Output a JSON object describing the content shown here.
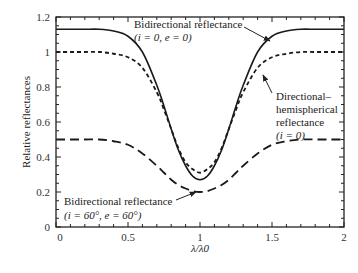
{
  "chart_data": {
    "type": "line",
    "title": "",
    "xlabel": "λ/λ0",
    "ylabel": "Relative reflectances",
    "xlim": [
      0,
      2
    ],
    "ylim": [
      0,
      1.2
    ],
    "x_ticks": [
      "0",
      "0.5",
      "1",
      "1.5",
      "2"
    ],
    "y_ticks": [
      "0",
      "0.2",
      "0.4",
      "0.6",
      "0.8",
      "1",
      "1.2"
    ],
    "grid": false,
    "legend": "annotations",
    "x": [
      0,
      0.1,
      0.2,
      0.3,
      0.4,
      0.5,
      0.6,
      0.7,
      0.75,
      0.8,
      0.85,
      0.9,
      0.95,
      1.0,
      1.05,
      1.1,
      1.15,
      1.2,
      1.25,
      1.3,
      1.4,
      1.5,
      1.6,
      1.7,
      1.8,
      1.9,
      2.0
    ],
    "series": [
      {
        "name": "Bidirectional reflectance (i = 0, e = 0)",
        "style": "solid",
        "values": [
          1.13,
          1.13,
          1.13,
          1.13,
          1.12,
          1.09,
          1.0,
          0.81,
          0.69,
          0.56,
          0.44,
          0.35,
          0.29,
          0.27,
          0.29,
          0.35,
          0.44,
          0.56,
          0.69,
          0.81,
          1.0,
          1.09,
          1.12,
          1.13,
          1.13,
          1.13,
          1.13
        ]
      },
      {
        "name": "Directional–hemispherical reflectance (i = 0)",
        "style": "short-dash",
        "values": [
          1.0,
          1.0,
          1.0,
          1.0,
          0.99,
          0.97,
          0.91,
          0.77,
          0.67,
          0.56,
          0.45,
          0.37,
          0.33,
          0.31,
          0.33,
          0.37,
          0.45,
          0.56,
          0.67,
          0.77,
          0.91,
          0.97,
          0.99,
          1.0,
          1.0,
          1.0,
          1.0
        ]
      },
      {
        "name": "Bidirectional reflectance (i = 60°, e = 60°)",
        "style": "long-dash",
        "values": [
          0.5,
          0.5,
          0.5,
          0.5,
          0.49,
          0.47,
          0.42,
          0.35,
          0.31,
          0.27,
          0.24,
          0.22,
          0.205,
          0.2,
          0.205,
          0.22,
          0.24,
          0.27,
          0.31,
          0.35,
          0.42,
          0.47,
          0.49,
          0.5,
          0.5,
          0.5,
          0.5
        ]
      }
    ],
    "annotations": [
      {
        "line1": "Bidirectional reflectance",
        "line2": "(i = 0, e = 0)"
      },
      {
        "line1": "Directional–",
        "line2": "hemispherical",
        "line3": "reflectance",
        "line4": "(i = 0)"
      },
      {
        "line1": "Bidirectional reflectance",
        "line2": "(i = 60°, e = 60°)"
      }
    ]
  }
}
